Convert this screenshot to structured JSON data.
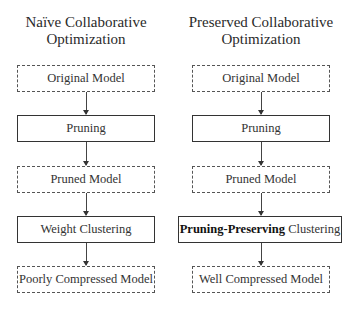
{
  "left": {
    "title_line1": "Naïve Collaborative",
    "title_line2": "Optimization",
    "steps": [
      {
        "label": "Original Model",
        "style": "dashed"
      },
      {
        "label": "Pruning",
        "style": "solid"
      },
      {
        "label": "Pruned Model",
        "style": "dashed"
      },
      {
        "label": "Weight Clustering",
        "style": "solid"
      },
      {
        "label": "Poorly Compressed Model",
        "style": "dashed"
      }
    ]
  },
  "right": {
    "title_line1": "Preserved Collaborative",
    "title_line2": "Optimization",
    "steps": [
      {
        "label": "Original Model",
        "style": "dashed"
      },
      {
        "label": "Pruning",
        "style": "solid"
      },
      {
        "label": "Pruned Model",
        "style": "dashed"
      },
      {
        "label_bold": "Pruning-Preserving",
        "label_rest": " Clustering",
        "style": "solid"
      },
      {
        "label": "Well Compressed Model",
        "style": "dashed"
      }
    ]
  }
}
